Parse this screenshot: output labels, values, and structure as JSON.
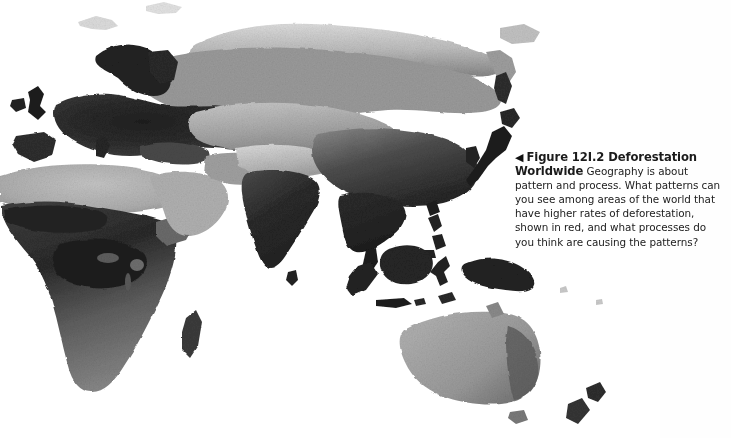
{
  "page": {
    "background_color": "#fefefe",
    "width": 731,
    "height": 438
  },
  "caption": {
    "marker_icon": "left-triangle-icon",
    "marker_glyph": "◀",
    "figure_label": "Figure 12I.2 Deforestation Worldwide",
    "figure_number": "12I.2",
    "title_line_1": "Figure 12I.2 Deforestation",
    "title_line_2": "Worldwide",
    "body_text": "Geography is about pattern and process. What patterns can you see among areas of the world that have higher rates of deforestation, shown in red, and what processes do you think are causing the patterns?",
    "lines": [
      "◀ Figure 12I.2 Deforestation",
      "Worldwide Geography is about pat-",
      "tern and process. What patterns can you",
      "see among areas of the world that have",
      "higher rates of deforestation, shown in",
      "red, and what processes do you think",
      "are causing the patterns?"
    ],
    "text_color": "#1b1b1b"
  },
  "map": {
    "name": "world-deforestation-map",
    "projection": "equirectangular-eastern-hemisphere",
    "rendering": "grayscale-satellite-raster",
    "ocean_color": "#ffffff",
    "land_colors": {
      "dense_vegetation_dark": "#3a3a3a",
      "very_dark": "#242424",
      "moderate_gray": "#8e8e8e",
      "arid_light_gray": "#b4b4b4",
      "pale_highland": "#cfcfcf",
      "ice_pale": "#e6e6e6"
    },
    "regions": [
      {
        "name": "Europe",
        "tone": "very_dark"
      },
      {
        "name": "Scandinavia",
        "tone": "very_dark"
      },
      {
        "name": "British Isles",
        "tone": "very_dark"
      },
      {
        "name": "Iberian Peninsula",
        "tone": "dense_vegetation_dark"
      },
      {
        "name": "North Africa / Sahara",
        "tone": "arid_light_gray"
      },
      {
        "name": "Sub-Saharan Africa",
        "tone": "dense_vegetation_dark"
      },
      {
        "name": "Congo Basin",
        "tone": "very_dark"
      },
      {
        "name": "Madagascar",
        "tone": "dense_vegetation_dark"
      },
      {
        "name": "Arabian Peninsula",
        "tone": "arid_light_gray"
      },
      {
        "name": "Siberia",
        "tone": "pale_highland"
      },
      {
        "name": "Russian Taiga",
        "tone": "moderate_gray"
      },
      {
        "name": "Central Asia",
        "tone": "arid_light_gray"
      },
      {
        "name": "Tibetan Plateau / Himalaya",
        "tone": "pale_highland"
      },
      {
        "name": "India",
        "tone": "very_dark"
      },
      {
        "name": "Sri Lanka",
        "tone": "very_dark"
      },
      {
        "name": "China",
        "tone": "dense_vegetation_dark"
      },
      {
        "name": "Korea",
        "tone": "very_dark"
      },
      {
        "name": "Japan",
        "tone": "very_dark"
      },
      {
        "name": "Sakhalin",
        "tone": "very_dark"
      },
      {
        "name": "Southeast Asia / Indochina",
        "tone": "very_dark"
      },
      {
        "name": "Philippines",
        "tone": "very_dark"
      },
      {
        "name": "Borneo",
        "tone": "very_dark"
      },
      {
        "name": "Sumatra",
        "tone": "very_dark"
      },
      {
        "name": "Java",
        "tone": "very_dark"
      },
      {
        "name": "Sulawesi",
        "tone": "very_dark"
      },
      {
        "name": "New Guinea",
        "tone": "very_dark"
      },
      {
        "name": "Australia",
        "tone": "moderate_gray"
      },
      {
        "name": "Tasmania",
        "tone": "moderate_gray"
      },
      {
        "name": "New Zealand",
        "tone": "dense_vegetation_dark"
      }
    ]
  }
}
